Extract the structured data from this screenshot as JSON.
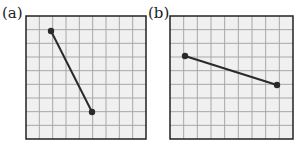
{
  "panels": [
    {
      "label": "(a)",
      "grid": {
        "x": 26,
        "y": 16,
        "width": 120,
        "height": 123,
        "cols": 9,
        "rows": 9
      },
      "segment": {
        "p1": [
          51,
          31
        ],
        "p2": [
          92,
          112
        ]
      }
    },
    {
      "label": "(b)",
      "grid": {
        "x": 170,
        "y": 16,
        "width": 123,
        "height": 123,
        "cols": 9,
        "rows": 9
      },
      "segment": {
        "p1": [
          185,
          56
        ],
        "p2": [
          277,
          85
        ]
      }
    }
  ],
  "colors": {
    "grid_bg": "#f0f0f0",
    "grid_line": "#a8a8a8",
    "border": "#222222",
    "segment": "#2a2a2a"
  }
}
